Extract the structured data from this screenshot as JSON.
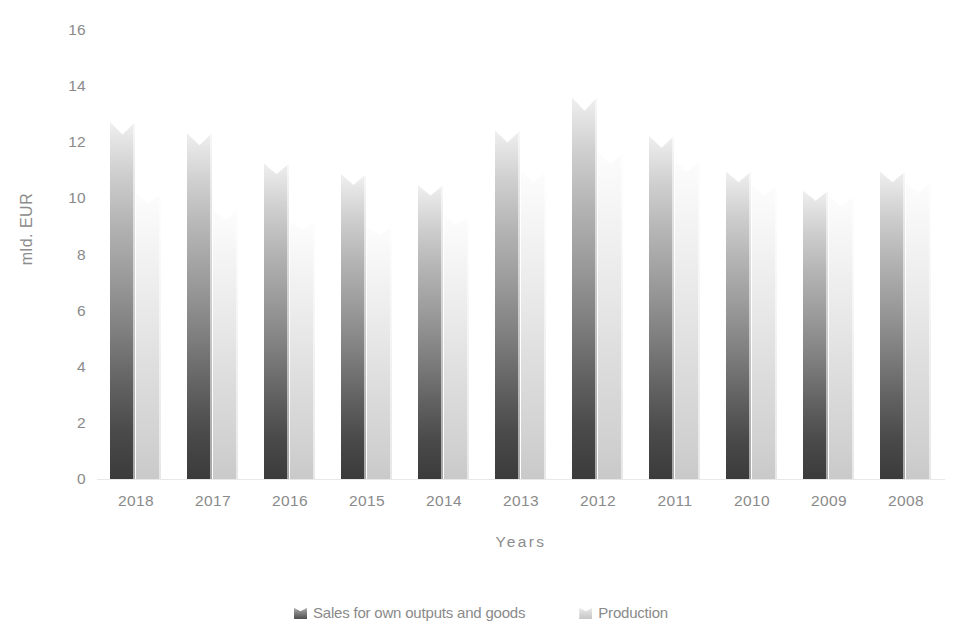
{
  "chart_data": {
    "type": "bar",
    "title": "",
    "subtitle": "",
    "xlabel": "Years",
    "ylabel": "mld. EUR",
    "categories": [
      "2018",
      "2017",
      "2016",
      "2015",
      "2014",
      "2013",
      "2012",
      "2011",
      "2010",
      "2009",
      "2008"
    ],
    "series": [
      {
        "name": "Sales for own outputs and goods",
        "color": "#4f4f4f",
        "values": [
          13.0,
          12.6,
          11.5,
          11.1,
          10.7,
          12.7,
          13.9,
          12.5,
          11.2,
          10.5,
          11.2
        ]
      },
      {
        "name": "Production",
        "color": "#c9c9c9",
        "values": [
          10.4,
          9.8,
          9.4,
          9.2,
          9.6,
          11.2,
          11.9,
          11.6,
          10.7,
          10.3,
          10.8
        ]
      }
    ],
    "ylim": [
      0,
      16
    ],
    "yticks": [
      16,
      14,
      12,
      10,
      8,
      6,
      4,
      2,
      0
    ],
    "grid": false,
    "legend_position": "bottom"
  },
  "axis": {
    "y_title": "mld. EUR",
    "x_title": "Years"
  },
  "legend": {
    "items": [
      {
        "label": "Sales for own outputs and goods"
      },
      {
        "label": "Production"
      }
    ]
  }
}
